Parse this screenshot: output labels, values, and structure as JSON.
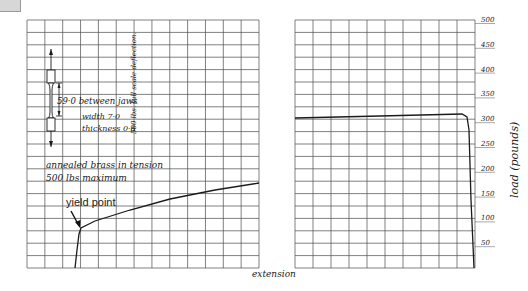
{
  "figure": {
    "x_label": "extension",
    "y_label": "load (pounds)",
    "y_ticks": [
      "50",
      "100",
      "150",
      "200",
      "250",
      "300",
      "350",
      "400",
      "450",
      "500"
    ],
    "left_panel": {
      "annotations": {
        "gauge_length": "59·0 between jaws",
        "width": "width 7·0",
        "thickness": "thickness 0·6",
        "full_scale": "500 lbs. full scale deflection.",
        "material": "annealed brass in tension",
        "max_load": "500 lbs maximum",
        "yield_point": "yield point"
      }
    },
    "right_panel": {}
  },
  "chart_data": [
    {
      "type": "line",
      "title": "annealed brass in tension (left panel)",
      "xlabel": "extension",
      "ylabel": "load (pounds)",
      "ylim": [
        0,
        500
      ],
      "grid": true,
      "annotations": [
        "yield point",
        "500 lbs maximum",
        "59·0 between jaws",
        "width 7·0",
        "thickness 0·6",
        "500 lbs. full scale deflection."
      ],
      "series": [
        {
          "name": "load vs extension",
          "points_px": [
            [
              75,
              268
            ],
            [
              77,
              250
            ],
            [
              79,
              234
            ],
            [
              81,
              228
            ],
            [
              95,
              221
            ],
            [
              130,
              210
            ],
            [
              170,
              199
            ],
            [
              215,
              190
            ],
            [
              259,
              183
            ]
          ],
          "approx_load_lbs": [
            0,
            35,
            68,
            80,
            94,
            116,
            138,
            156,
            170
          ]
        }
      ]
    },
    {
      "type": "line",
      "title": "right panel",
      "xlabel": "extension",
      "ylabel": "load (pounds)",
      "ylim": [
        0,
        500
      ],
      "grid": true,
      "series": [
        {
          "name": "load vs extension",
          "points_px": [
            [
              295,
              118
            ],
            [
              380,
              116
            ],
            [
              462,
              114
            ],
            [
              467,
              117
            ],
            [
              469,
              130
            ],
            [
              471,
              200
            ],
            [
              474,
              268
            ]
          ],
          "approx_load_lbs": [
            300,
            304,
            308,
            302,
            276,
            136,
            0
          ]
        }
      ]
    }
  ]
}
